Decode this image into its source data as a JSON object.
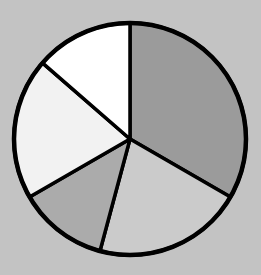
{
  "background_color": "#c3c3c3",
  "chart_data": {
    "type": "pie",
    "title": "",
    "subtitle": "",
    "legend": "none",
    "labels_shown": false,
    "center_x": 130,
    "center_y": 139,
    "radius": 116,
    "start_angle_deg_from_top": 0,
    "direction": "clockwise",
    "stroke_color": "#000000",
    "slice_stroke_width": 3.5,
    "outer_rim_stroke_width": 4.5,
    "slices": [
      {
        "name": "dark-gray-slice",
        "angle_deg": 120,
        "fraction": 0.333,
        "color": "#9b9b9b"
      },
      {
        "name": "light-gray-slice",
        "angle_deg": 75,
        "fraction": 0.208,
        "color": "#cbcbcb"
      },
      {
        "name": "medium-gray-slice",
        "angle_deg": 45,
        "fraction": 0.125,
        "color": "#ababab"
      },
      {
        "name": "pale-gray-slice",
        "angle_deg": 71,
        "fraction": 0.197,
        "color": "#f2f2f2"
      },
      {
        "name": "white-slice",
        "angle_deg": 49,
        "fraction": 0.136,
        "color": "#ffffff"
      }
    ]
  }
}
